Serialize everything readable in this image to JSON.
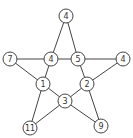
{
  "diagram": {
    "type": "star-graph",
    "node_radius": 7,
    "nodes": [
      {
        "id": "top",
        "label": "4",
        "x": 66,
        "y": 16
      },
      {
        "id": "left",
        "label": "7",
        "x": 10,
        "y": 59
      },
      {
        "id": "inner_l",
        "label": "4",
        "x": 51,
        "y": 59
      },
      {
        "id": "inner_r",
        "label": "5",
        "x": 78,
        "y": 59
      },
      {
        "id": "right",
        "label": "4",
        "x": 123,
        "y": 59
      },
      {
        "id": "mid_l",
        "label": "1",
        "x": 43,
        "y": 84
      },
      {
        "id": "mid_r",
        "label": "2",
        "x": 87,
        "y": 84
      },
      {
        "id": "center",
        "label": "3",
        "x": 65,
        "y": 101
      },
      {
        "id": "bottom_l",
        "label": "11",
        "x": 30,
        "y": 128
      },
      {
        "id": "bottom_r",
        "label": "9",
        "x": 101,
        "y": 126
      }
    ],
    "edges": [
      [
        "top",
        "inner_l"
      ],
      [
        "top",
        "inner_r"
      ],
      [
        "left",
        "inner_l"
      ],
      [
        "inner_l",
        "inner_r"
      ],
      [
        "inner_r",
        "right"
      ],
      [
        "left",
        "mid_l"
      ],
      [
        "inner_l",
        "mid_l"
      ],
      [
        "inner_r",
        "mid_r"
      ],
      [
        "right",
        "mid_r"
      ],
      [
        "mid_l",
        "center"
      ],
      [
        "mid_l",
        "bottom_l"
      ],
      [
        "mid_r",
        "center"
      ],
      [
        "mid_r",
        "bottom_r"
      ],
      [
        "center",
        "bottom_l"
      ],
      [
        "center",
        "bottom_r"
      ]
    ],
    "colors": {
      "stroke": "#444444",
      "fill": "#ffffff",
      "text": "#333333"
    }
  }
}
